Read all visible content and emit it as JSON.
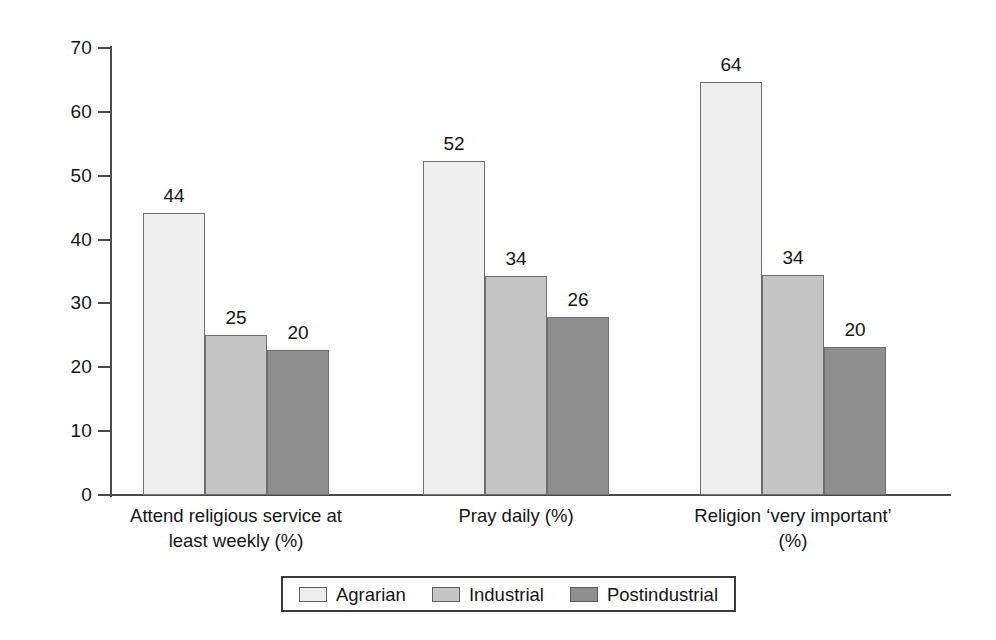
{
  "chart_data": {
    "type": "bar",
    "title": "",
    "subtitle": "",
    "xlabel": "",
    "ylabel": "",
    "ylim": [
      0,
      70
    ],
    "ytick_step": 10,
    "yticks": [
      70,
      60,
      50,
      40,
      30,
      20,
      10,
      0
    ],
    "grid": false,
    "legend_position": "bottom-center",
    "categories": [
      "Attend religious service at\nleast weekly (%)",
      "Pray daily (%)",
      "Religion ‘very important’\n(%)"
    ],
    "series": [
      {
        "name": "Agrarian",
        "color": "#eeeeee",
        "values": [
          44,
          52,
          64
        ],
        "drawn_heights": [
          44.2,
          52.3,
          64.6
        ]
      },
      {
        "name": "Industrial",
        "color": "#c5c5c5",
        "values": [
          25,
          34,
          34
        ],
        "drawn_heights": [
          25.0,
          34.3,
          34.4
        ]
      },
      {
        "name": "Postindustrial",
        "color": "#8f8f8f",
        "values": [
          20,
          26,
          20
        ],
        "drawn_heights": [
          22.7,
          27.9,
          23.1
        ]
      }
    ],
    "data_labels": [
      [
        "44",
        "25",
        "20"
      ],
      [
        "52",
        "34",
        "26"
      ],
      [
        "64",
        "34",
        "20"
      ]
    ]
  },
  "legend": {
    "entries": [
      {
        "label": "Agrarian",
        "swatch": "legend-swatch-agrarian"
      },
      {
        "label": "Industrial",
        "swatch": "legend-swatch-industrial"
      },
      {
        "label": "Postindustrial",
        "swatch": "legend-swatch-postindustrial"
      }
    ]
  },
  "colors": {
    "agrarian": "#eeeeee",
    "industrial": "#c5c5c5",
    "postindustrial": "#8f8f8f",
    "axis": "#4a4a4a",
    "text": "#141414",
    "background": "#ffffff"
  }
}
